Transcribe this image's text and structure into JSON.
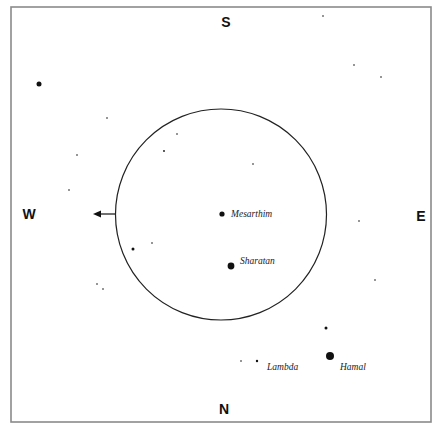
{
  "diagram": {
    "type": "sky-chart",
    "frame": {
      "x": 11,
      "y": 7,
      "width": 420,
      "height": 415,
      "color": "#8a8a8a"
    },
    "directions": [
      {
        "label": "S",
        "x": 226,
        "y": 27
      },
      {
        "label": "N",
        "x": 224,
        "y": 414
      },
      {
        "label": "W",
        "x": 29,
        "y": 219
      },
      {
        "label": "E",
        "x": 421,
        "y": 221
      }
    ],
    "field_circle": {
      "cx": 221,
      "cy": 214.5,
      "r": 105.5
    },
    "arrow": {
      "x1": 115,
      "y1": 214,
      "x2": 93,
      "y2": 214,
      "direction": "west"
    },
    "named_stars": [
      {
        "name": "Mesarthim",
        "x": 222,
        "y": 214,
        "r": 2.6,
        "label_x": 231,
        "label_y": 217
      },
      {
        "name": "Sharatan",
        "x": 231,
        "y": 266,
        "r": 3.4,
        "label_x": 240,
        "label_y": 264
      },
      {
        "name": "Lambda",
        "x": 257,
        "y": 361,
        "r": 1.2,
        "label_x": 267,
        "label_y": 370
      },
      {
        "name": "Hamal",
        "x": 330,
        "y": 356,
        "r": 4,
        "label_x": 340,
        "label_y": 370
      }
    ],
    "stars": [
      {
        "x": 39,
        "y": 84,
        "r": 2.5
      },
      {
        "x": 133,
        "y": 249,
        "r": 1.5
      },
      {
        "x": 326,
        "y": 328,
        "r": 1.5
      },
      {
        "x": 323,
        "y": 16,
        "r": 0.8
      },
      {
        "x": 354,
        "y": 65,
        "r": 0.8
      },
      {
        "x": 381,
        "y": 77,
        "r": 0.8
      },
      {
        "x": 107,
        "y": 118,
        "r": 0.8
      },
      {
        "x": 177,
        "y": 134,
        "r": 0.8
      },
      {
        "x": 164,
        "y": 151,
        "r": 0.9
      },
      {
        "x": 77,
        "y": 155,
        "r": 0.8
      },
      {
        "x": 253,
        "y": 164,
        "r": 0.8
      },
      {
        "x": 69,
        "y": 190,
        "r": 0.8
      },
      {
        "x": 359,
        "y": 221,
        "r": 0.8
      },
      {
        "x": 152,
        "y": 243,
        "r": 0.8
      },
      {
        "x": 375,
        "y": 280,
        "r": 0.8
      },
      {
        "x": 97,
        "y": 284,
        "r": 0.8
      },
      {
        "x": 103,
        "y": 289,
        "r": 0.8
      },
      {
        "x": 241,
        "y": 361,
        "r": 0.8
      }
    ]
  }
}
